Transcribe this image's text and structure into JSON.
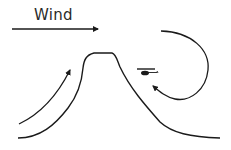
{
  "diagram": {
    "wind_label": "Wind",
    "stroke_color": "#1a1a1a",
    "elements": [
      {
        "name": "wind-arrow",
        "direction": "right"
      },
      {
        "name": "mountain-ridge"
      },
      {
        "name": "upslope-airflow-arrow",
        "direction": "up-right"
      },
      {
        "name": "leeside-rotor-arrow",
        "direction": "circular-downward"
      },
      {
        "name": "helicopter",
        "position": "lee side of mountain"
      }
    ]
  }
}
